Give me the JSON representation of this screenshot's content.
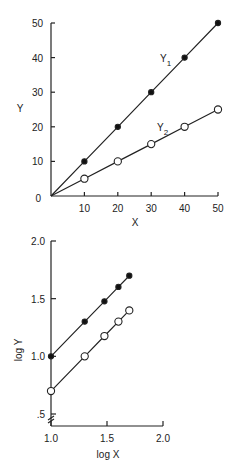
{
  "chart_data": [
    {
      "type": "line",
      "title": "",
      "xlabel": "X",
      "ylabel": "Y",
      "xlim": [
        0,
        50
      ],
      "ylim": [
        0,
        50
      ],
      "grid": false,
      "x_ticks": [
        "10",
        "20",
        "30",
        "40",
        "50"
      ],
      "y_ticks": [
        "10",
        "20",
        "30",
        "40",
        "50"
      ],
      "origin_label": "0",
      "x": [
        0,
        10,
        20,
        30,
        40,
        50
      ],
      "series": [
        {
          "name": "Y1",
          "label_main": "Y",
          "label_sub": "1",
          "marker": "filled-circle",
          "values": [
            0,
            10,
            20,
            30,
            40,
            50
          ]
        },
        {
          "name": "Y2",
          "label_main": "Y",
          "label_sub": "2",
          "marker": "open-circle",
          "values": [
            0,
            5,
            10,
            15,
            20,
            25
          ]
        }
      ]
    },
    {
      "type": "line",
      "title": "",
      "xlabel": "log X",
      "ylabel": "log Y",
      "xlim": [
        1.0,
        2.0
      ],
      "ylim": [
        0.5,
        2.0
      ],
      "grid": false,
      "x_ticks": [
        "1.0",
        "1.5",
        "2.0"
      ],
      "y_ticks": [
        ".5",
        "1.0",
        "1.5",
        "2.0"
      ],
      "axis_break": "y-axis break below .5",
      "x": [
        1.0,
        1.301,
        1.477,
        1.602,
        1.699
      ],
      "series": [
        {
          "name": "log Y1",
          "marker": "filled-circle",
          "values": [
            1.0,
            1.301,
            1.477,
            1.602,
            1.699
          ]
        },
        {
          "name": "log Y2",
          "marker": "open-circle",
          "values": [
            0.699,
            1.0,
            1.176,
            1.301,
            1.398
          ]
        }
      ]
    }
  ]
}
